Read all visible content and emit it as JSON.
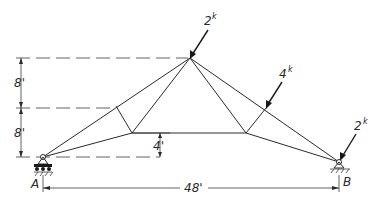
{
  "diagram": {
    "type": "truss",
    "loads": [
      {
        "id": "load-apex",
        "magnitude": "2",
        "unit": "k"
      },
      {
        "id": "load-right-upper",
        "magnitude": "4",
        "unit": "k"
      },
      {
        "id": "load-support-b",
        "magnitude": "2",
        "unit": "k"
      }
    ],
    "dimensions": {
      "upper_height": "8'",
      "lower_height": "8'",
      "chord_rise": "4'",
      "span": "48'"
    },
    "supports": [
      {
        "id": "A",
        "label": "A",
        "type": "roller"
      },
      {
        "id": "B",
        "label": "B",
        "type": "pin"
      }
    ]
  }
}
